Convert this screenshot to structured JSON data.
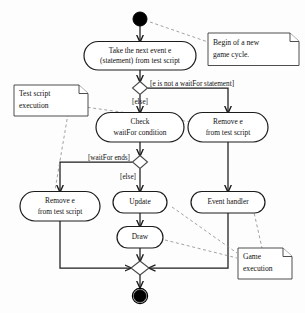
{
  "diagram": {
    "kind": "uml-activity-diagram",
    "background_color": "#fdfdfd",
    "line_color": "#1c1c1c",
    "anchor_color": "#8a8a8a",
    "nodes": {
      "start": {
        "name": "initial-node",
        "type": "initial"
      },
      "take_event": {
        "label_line1": "Take the next event e",
        "label_line2": "(statement) from test script"
      },
      "decision_waitfor": {
        "name": "decision-is-waitfor",
        "type": "decision"
      },
      "check_waitfor": {
        "label_line1": "Check",
        "label_line2": "waitFor condition"
      },
      "remove_top": {
        "label_line1": "Remove e",
        "label_line2": "from test script"
      },
      "decision_ends": {
        "name": "decision-waitfor-ends",
        "type": "decision"
      },
      "remove_bottom": {
        "label_line1": "Remove e",
        "label_line2": "from test script"
      },
      "update": {
        "label_line1": "Update"
      },
      "draw": {
        "label_line1": "Draw"
      },
      "event_handler": {
        "label_line1": "Event handler"
      },
      "merge": {
        "name": "merge-node",
        "type": "merge"
      },
      "final": {
        "name": "final-node",
        "type": "final"
      }
    },
    "guards": {
      "not_waitfor": "[e is not a waitFor statement]",
      "else_top": "[else]",
      "waitfor_ends": "[waitFor ends]",
      "else_bottom": "[else]"
    },
    "notes": {
      "begin_cycle": {
        "line1": "Begin of a new",
        "line2": "game cycle."
      },
      "test_script": {
        "line1": "Test script",
        "line2": "execution"
      },
      "game_execution": {
        "line1": "Game",
        "line2": "execution"
      }
    }
  }
}
